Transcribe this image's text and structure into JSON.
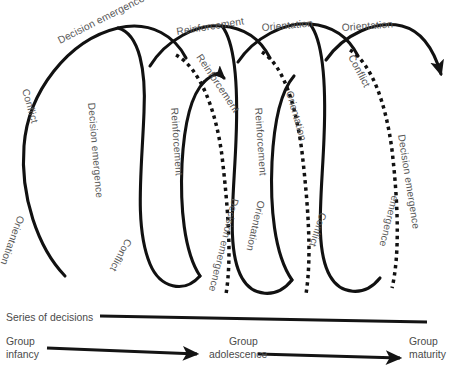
{
  "diagram": {
    "type": "spiral-helix-diagram",
    "colors": {
      "stroke": "#111111",
      "label": "#585858",
      "background": "#ffffff"
    },
    "phases": [
      "Conflict",
      "Decision emergence",
      "Reinforcement",
      "Orientation"
    ],
    "top_labels": [
      {
        "text": "Decision emergence",
        "x": 60,
        "y": 44,
        "rotate": -27
      },
      {
        "text": "Reinforcement",
        "x": 177,
        "y": 35,
        "rotate": -9
      },
      {
        "text": "Orientation",
        "x": 262,
        "y": 31,
        "rotate": -5
      },
      {
        "text": "Orientation",
        "x": 342,
        "y": 31,
        "rotate": -4
      }
    ],
    "front_labels": [
      {
        "text": "Conflict",
        "x": 22,
        "y": 90,
        "rotate": 74
      },
      {
        "text": "Decision emergence",
        "x": 88,
        "y": 103,
        "rotate": 85
      },
      {
        "text": "Reinforcement",
        "x": 171,
        "y": 108,
        "rotate": 86
      },
      {
        "text": "Reinforcement",
        "x": 255,
        "y": 108,
        "rotate": 86
      }
    ],
    "back_labels": [
      {
        "text": "Reinforcement",
        "x": 196,
        "y": 57,
        "rotate": 56
      },
      {
        "text": "Orientation",
        "x": 286,
        "y": 92,
        "rotate": 74
      },
      {
        "text": "Conflict",
        "x": 348,
        "y": 57,
        "rotate": 62
      },
      {
        "text": "Decision emergence",
        "x": 398,
        "y": 135,
        "rotate": 81
      }
    ],
    "lower_labels": [
      {
        "text": "Orientation",
        "x": 18,
        "y": 215,
        "rotate": 110
      },
      {
        "text": "Conflict",
        "x": 126,
        "y": 238,
        "rotate": 118
      },
      {
        "text": "Decision emergence",
        "x": 232,
        "y": 198,
        "rotate": 104
      },
      {
        "text": "Orientation",
        "x": 258,
        "y": 200,
        "rotate": 103
      },
      {
        "text": "Conflict",
        "x": 320,
        "y": 212,
        "rotate": 108
      },
      {
        "text": "emergence",
        "x": 392,
        "y": 195,
        "rotate": 104
      }
    ],
    "axis": {
      "series_label": "Series of decisions",
      "series_line": {
        "x1": 100,
        "y1": 316,
        "x2": 427,
        "y2": 322
      }
    },
    "timeline": {
      "stages": [
        {
          "line1": "Group",
          "line2": "infancy",
          "x": 6,
          "y": 338
        },
        {
          "line1": "Group",
          "line2": "adolescence",
          "x": 215,
          "y": 338
        },
        {
          "line1": "Group",
          "line2": "maturity",
          "x": 406,
          "y": 338
        }
      ],
      "arrows": [
        {
          "x1": 47,
          "y1": 348,
          "x2": 197,
          "y2": 354
        },
        {
          "x1": 258,
          "y1": 354,
          "x2": 400,
          "y2": 358
        }
      ]
    }
  }
}
